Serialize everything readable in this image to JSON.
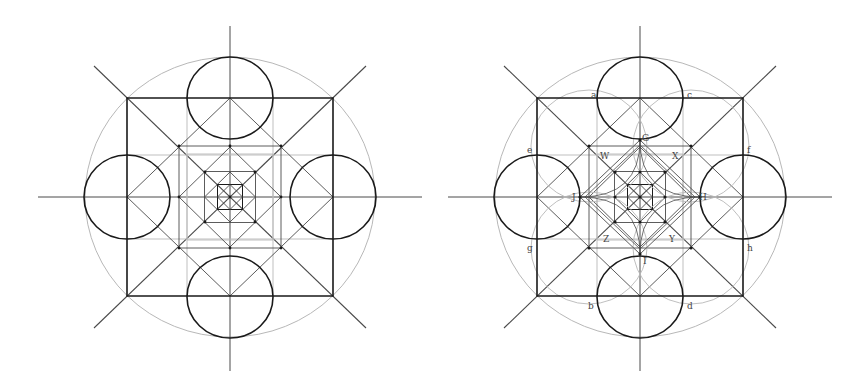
{
  "figures": [
    {
      "id": "left",
      "title": "",
      "center": [
        230,
        197
      ],
      "labels": []
    },
    {
      "id": "right",
      "title": "",
      "center": [
        640,
        197
      ],
      "labels": [
        {
          "text": "a",
          "x": 591,
          "y": 98
        },
        {
          "text": "c",
          "x": 687,
          "y": 98
        },
        {
          "text": "e",
          "x": 527,
          "y": 153
        },
        {
          "text": "f",
          "x": 747,
          "y": 153
        },
        {
          "text": "g",
          "x": 527,
          "y": 251
        },
        {
          "text": "h",
          "x": 747,
          "y": 251
        },
        {
          "text": "b",
          "x": 588,
          "y": 309
        },
        {
          "text": "d",
          "x": 687,
          "y": 309
        },
        {
          "text": "G",
          "x": 642,
          "y": 141
        },
        {
          "text": "W",
          "x": 600,
          "y": 159
        },
        {
          "text": "X",
          "x": 672,
          "y": 159
        },
        {
          "text": "J",
          "x": 572,
          "y": 200
        },
        {
          "text": "H",
          "x": 699,
          "y": 200
        },
        {
          "text": "Z",
          "x": 603,
          "y": 242
        },
        {
          "text": "Y",
          "x": 669,
          "y": 242
        },
        {
          "text": "I",
          "x": 643,
          "y": 264
        }
      ]
    }
  ],
  "colors": {
    "heavy": "#1a1a1a",
    "medium": "#4a4a4a",
    "light": "#b8b8b8"
  }
}
